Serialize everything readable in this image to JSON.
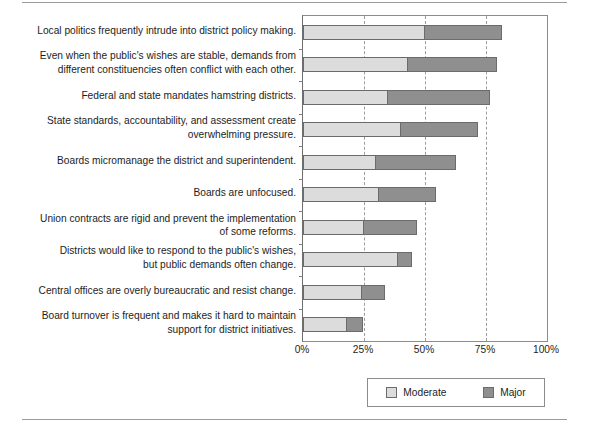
{
  "chart_data": {
    "type": "bar",
    "orientation": "horizontal",
    "stacked": true,
    "title": "",
    "subtitle": "",
    "xlabel": "",
    "ylabel": "",
    "xlim": [
      0,
      100
    ],
    "grid": true,
    "grid_axis": "x",
    "legend_position": "bottom-right",
    "xticks": [
      "0%",
      "25%",
      "50%",
      "75%",
      "100%"
    ],
    "xtick_values": [
      0,
      25,
      50,
      75,
      100
    ],
    "categories": [
      "Local politics frequently intrude into district policy making.",
      "Even when the public's wishes are stable, demands from\ndifferent constituencies often conflict with each other.",
      "Federal and state mandates hamstring districts.",
      "State standards, accountability, and assessment create\noverwhelming pressure.",
      "Boards micromanage the district and superintendent.",
      "Boards are unfocused.",
      "Union contracts are rigid and prevent the implementation\nof some reforms.",
      "Districts would like to respond to the public's wishes,\nbut public demands often change.",
      "Central offices are overly bureaucratic and resist change.",
      "Board turnover is frequent and makes it hard to  maintain\nsupport for district initiatives."
    ],
    "series": [
      {
        "name": "Moderate",
        "color": "#dcdcdc",
        "values": [
          50,
          43,
          35,
          40,
          30,
          31,
          25,
          39,
          24,
          18
        ]
      },
      {
        "name": "Major",
        "color": "#8f8f8f",
        "values": [
          32,
          37,
          42,
          32,
          33,
          24,
          22,
          6,
          10,
          7
        ]
      }
    ],
    "totals": [
      82,
      80,
      77,
      72,
      63,
      55,
      47,
      45,
      34,
      25
    ]
  },
  "legend": {
    "entries": [
      {
        "label": "Moderate",
        "color": "#dcdcdc"
      },
      {
        "label": "Major",
        "color": "#8f8f8f"
      }
    ]
  }
}
